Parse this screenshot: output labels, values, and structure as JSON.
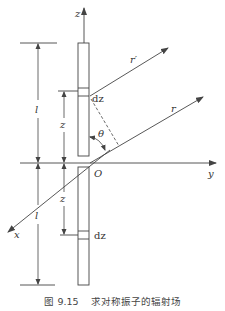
{
  "figure": {
    "caption": "图 9.15    求对称振子的辐射场",
    "labels": {
      "z_axis": "z",
      "y_axis": "y",
      "x_axis": "x",
      "origin": "O",
      "r_prime": "r′",
      "r": "r",
      "theta": "θ",
      "dz_top": "dz",
      "dz_bottom": "dz",
      "l_top": "l",
      "l_bottom": "l",
      "z_top": "z",
      "z_bottom": "z"
    },
    "colors": {
      "line": "#444444",
      "background": "#ffffff"
    }
  }
}
